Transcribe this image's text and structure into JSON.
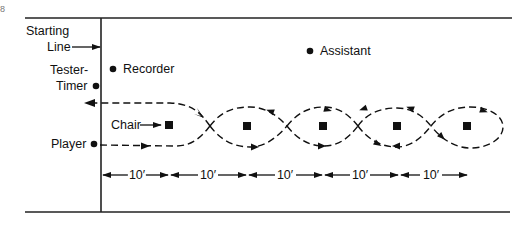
{
  "diagram": {
    "type": "field-layout",
    "labels": {
      "starting_line": [
        "Starting",
        "Line"
      ],
      "tester_timer": [
        "Tester-",
        "Timer"
      ],
      "recorder": "Recorder",
      "assistant": "Assistant",
      "chair": "Chair",
      "player": "Player"
    },
    "corner_mark": "8",
    "chairs": [
      {
        "index": 1,
        "x": 169,
        "y": 126
      },
      {
        "index": 2,
        "x": 247,
        "y": 126
      },
      {
        "index": 3,
        "x": 323,
        "y": 126
      },
      {
        "index": 4,
        "x": 397,
        "y": 126
      },
      {
        "index": 5,
        "x": 467,
        "y": 126
      }
    ],
    "dimensions": [
      {
        "label": "10′",
        "from": 102,
        "to": 168
      },
      {
        "label": "10′",
        "from": 170,
        "to": 246
      },
      {
        "label": "10′",
        "from": 248,
        "to": 322
      },
      {
        "label": "10′",
        "from": 324,
        "to": 398
      },
      {
        "label": "10′",
        "from": 400,
        "to": 466
      }
    ],
    "path": {
      "description": "Player weaves in figure-eight around 5 chairs and returns across starting line",
      "style": "dashed",
      "direction_out_y": 146,
      "direction_back_y": 103
    },
    "colors": {
      "ink": "#111111",
      "background": "#ffffff"
    }
  }
}
